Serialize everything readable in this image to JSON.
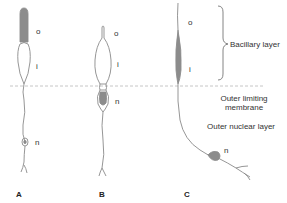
{
  "figure": {
    "colors": {
      "outline": "#8a8a8a",
      "fill": "#8c8c8c",
      "dash": "#b8b8b8",
      "background": "#ffffff"
    },
    "cells": [
      {
        "panel": "A",
        "labels": {
          "outer": "o",
          "inner": "i",
          "nucleus": "n"
        }
      },
      {
        "panel": "B",
        "labels": {
          "outer": "o",
          "inner": "i",
          "nucleus": "n"
        }
      },
      {
        "panel": "C",
        "labels": {
          "outer": "o",
          "inner": "i",
          "nucleus": "n"
        }
      }
    ],
    "layers": {
      "bacillary": "Bacillary layer",
      "olm_line1": "Outer limiting",
      "olm_line2": "membrane",
      "outer_nuclear": "Outer nuclear layer"
    }
  }
}
